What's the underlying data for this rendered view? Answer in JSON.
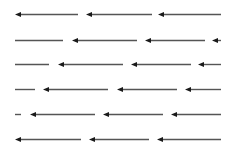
{
  "diagram": {
    "title": "",
    "line_color": "#555555",
    "head_color": "#1a1a1a",
    "rows": [
      {
        "y": 14,
        "segments": [
          {
            "x1": 15,
            "x2": 78,
            "head": true
          },
          {
            "x1": 86,
            "x2": 152,
            "head": true
          },
          {
            "x1": 158,
            "x2": 221,
            "head": true
          }
        ]
      },
      {
        "y": 40,
        "segments": [
          {
            "x1": 15,
            "x2": 63,
            "head": false
          },
          {
            "x1": 72,
            "x2": 137,
            "head": true
          },
          {
            "x1": 145,
            "x2": 205,
            "head": true
          },
          {
            "x1": 212,
            "x2": 221,
            "head": true
          }
        ]
      },
      {
        "y": 64,
        "segments": [
          {
            "x1": 15,
            "x2": 49,
            "head": false
          },
          {
            "x1": 58,
            "x2": 123,
            "head": true
          },
          {
            "x1": 131,
            "x2": 191,
            "head": true
          },
          {
            "x1": 198,
            "x2": 221,
            "head": true
          }
        ]
      },
      {
        "y": 89,
        "segments": [
          {
            "x1": 15,
            "x2": 35,
            "head": false
          },
          {
            "x1": 43,
            "x2": 108,
            "head": true
          },
          {
            "x1": 117,
            "x2": 177,
            "head": true
          },
          {
            "x1": 185,
            "x2": 221,
            "head": true
          }
        ]
      },
      {
        "y": 114,
        "segments": [
          {
            "x1": 15,
            "x2": 21,
            "head": false
          },
          {
            "x1": 30,
            "x2": 95,
            "head": true
          },
          {
            "x1": 103,
            "x2": 163,
            "head": true
          },
          {
            "x1": 171,
            "x2": 221,
            "head": true
          }
        ]
      },
      {
        "y": 139,
        "segments": [
          {
            "x1": 15,
            "x2": 81,
            "head": true
          },
          {
            "x1": 89,
            "x2": 149,
            "head": true
          },
          {
            "x1": 157,
            "x2": 221,
            "head": true
          }
        ]
      }
    ]
  }
}
